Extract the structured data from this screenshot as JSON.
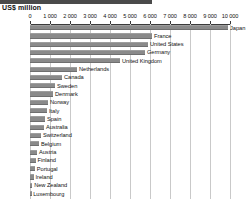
{
  "header": {
    "axis_title": "US$ million",
    "band_color": "#4a4a4a"
  },
  "style": {
    "bar_color": "#8a8a8a",
    "grid_color": "#c9c9c9",
    "axis_color": "#3a3a3a",
    "text_color": "#111111"
  },
  "chart_data": {
    "type": "bar",
    "orientation": "horizontal",
    "title": "US$ million",
    "xlabel": "US$ million",
    "ylabel": "",
    "xlim": [
      0,
      10000
    ],
    "xticks": [
      0,
      1000,
      2000,
      3000,
      4000,
      5000,
      6000,
      7000,
      8000,
      9000,
      10000
    ],
    "xtick_labels": [
      "0",
      "1 000",
      "2 000",
      "3 000",
      "4 000",
      "5 000",
      "6 000",
      "7 000",
      "8 000",
      "9 000",
      "10 000"
    ],
    "grid": true,
    "grid_axis": "x",
    "legend": false,
    "categories": [
      "Japan",
      "France",
      "United States",
      "Germany",
      "United Kingdom",
      "Netherlands",
      "Canada",
      "Sweden",
      "Denmark",
      "Norway",
      "Italy",
      "Spain",
      "Australia",
      "Switzerland",
      "Belgium",
      "Austria",
      "Finland",
      "Portugal",
      "Ireland",
      "New Zealand",
      "Luxembourg"
    ],
    "values": [
      9900,
      6100,
      5900,
      5750,
      4500,
      2350,
      1600,
      1250,
      1150,
      900,
      850,
      750,
      700,
      550,
      450,
      350,
      280,
      240,
      180,
      110,
      60
    ]
  }
}
